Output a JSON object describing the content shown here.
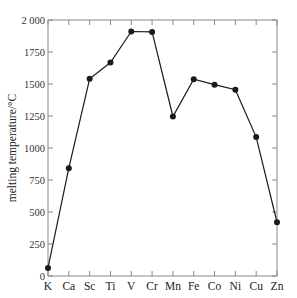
{
  "chart_data": {
    "type": "line",
    "title": "",
    "xlabel": "",
    "ylabel": "melting temperature/°C",
    "categories": [
      "K",
      "Ca",
      "Sc",
      "Ti",
      "V",
      "Cr",
      "Mn",
      "Fe",
      "Co",
      "Ni",
      "Cu",
      "Zn"
    ],
    "series": [
      {
        "name": "melting temperature",
        "values": [
          63,
          842,
          1541,
          1668,
          1910,
          1907,
          1246,
          1538,
          1495,
          1455,
          1085,
          420
        ]
      }
    ],
    "ylim": [
      0,
      2000
    ],
    "yticks": [
      0,
      250,
      500,
      750,
      1000,
      1250,
      1500,
      1750,
      2000
    ],
    "ytick_labels": [
      "0",
      "250",
      "500",
      "750",
      "1000",
      "1250",
      "1500",
      "1750",
      "2 000"
    ],
    "grid": false,
    "legend": null,
    "markers": "filled-circle",
    "colors": {
      "line": "#1a1a1a",
      "axis": "#888888",
      "text": "#333333"
    }
  }
}
